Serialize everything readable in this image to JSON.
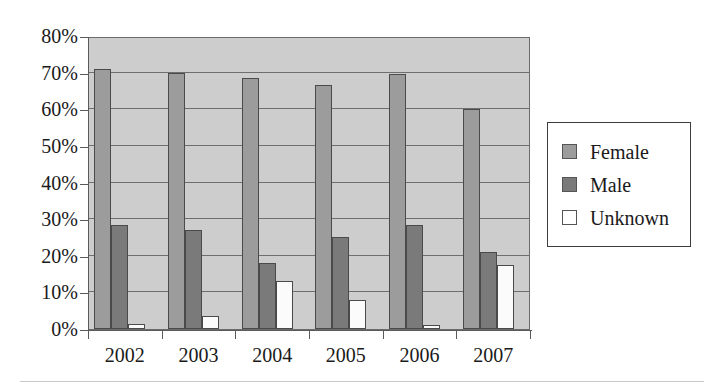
{
  "chart_data": {
    "type": "bar",
    "title": "",
    "subtitle": "",
    "xlabel": "",
    "ylabel": "",
    "categories": [
      "2002",
      "2003",
      "2004",
      "2005",
      "2006",
      "2007"
    ],
    "series": [
      {
        "name": "Female",
        "color": "#9c9c9c",
        "values": [
          71.0,
          70.0,
          68.5,
          66.5,
          69.5,
          60.0
        ]
      },
      {
        "name": "Male",
        "color": "#7a7a7a",
        "values": [
          28.5,
          27.0,
          18.0,
          25.0,
          28.5,
          21.0
        ]
      },
      {
        "name": "Unknown",
        "color": "#ffffff",
        "values": [
          1.5,
          3.5,
          13.0,
          8.0,
          1.2,
          17.5
        ]
      }
    ],
    "ylim": [
      0,
      80
    ],
    "ytick_values": [
      0,
      10,
      20,
      30,
      40,
      50,
      60,
      70,
      80
    ],
    "ytick_labels": [
      "0%",
      "10%",
      "20%",
      "30%",
      "40%",
      "50%",
      "60%",
      "70%",
      "80%"
    ],
    "grid": true,
    "grid_axis": "y",
    "legend_position": "right",
    "plot_background": "#cdcdcd",
    "figure_background": "#ffffff"
  },
  "legend": {
    "items": [
      {
        "label": "Female",
        "swatch": "series-female"
      },
      {
        "label": "Male",
        "swatch": "series-male"
      },
      {
        "label": "Unknown",
        "swatch": "series-unknown"
      }
    ]
  }
}
